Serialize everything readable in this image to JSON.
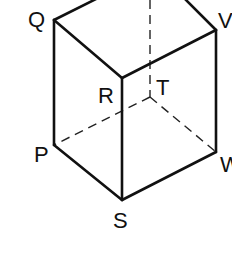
{
  "diagram": {
    "type": "cube",
    "labels": {
      "Q": "Q",
      "V": "V",
      "R": "R",
      "T": "T",
      "P": "P",
      "W": "W",
      "S": "S"
    },
    "vertices": {
      "Q": [
        54,
        20
      ],
      "V": [
        216,
        30
      ],
      "R": [
        122,
        78
      ],
      "T": [
        150,
        97
      ],
      "P": [
        54,
        145
      ],
      "W": [
        216,
        152
      ],
      "S": [
        122,
        200
      ]
    },
    "edges_visible": [
      "Q-R",
      "R-V",
      "Q-P",
      "P-S",
      "S-W",
      "R-S",
      "V-W",
      "Q-top",
      "V-top"
    ],
    "edges_hidden": [
      "T-P",
      "T-W",
      "T-top"
    ]
  }
}
